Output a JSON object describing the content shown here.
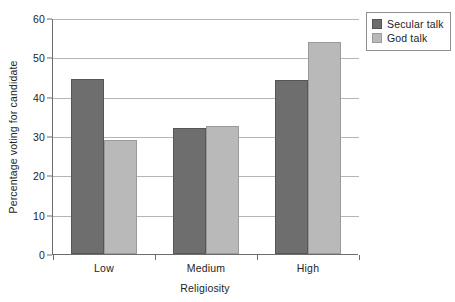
{
  "chart_data": {
    "type": "bar",
    "title": "",
    "xlabel": "Religiosity",
    "ylabel": "Percentage voting for candidate",
    "categories": [
      "Low",
      "Medium",
      "High"
    ],
    "series": [
      {
        "name": "Secular talk",
        "color": "#6e6e6e",
        "values": [
          44.5,
          32.0,
          44.3
        ]
      },
      {
        "name": "God talk",
        "color": "#b9b9b9",
        "values": [
          29.0,
          32.5,
          54.0
        ]
      }
    ],
    "ylim": [
      0,
      60
    ],
    "yticks": [
      0,
      10,
      20,
      30,
      40,
      50,
      60
    ],
    "ytick_labels": [
      "0",
      "10",
      "20",
      "30",
      "40",
      "50",
      "60"
    ],
    "grid": "horizontal",
    "legend_position": "top-right-outside"
  },
  "legend": {
    "items": [
      {
        "label": "Secular talk",
        "swatch": "dark-gray-swatch"
      },
      {
        "label": "God talk",
        "swatch": "light-gray-swatch"
      }
    ]
  }
}
